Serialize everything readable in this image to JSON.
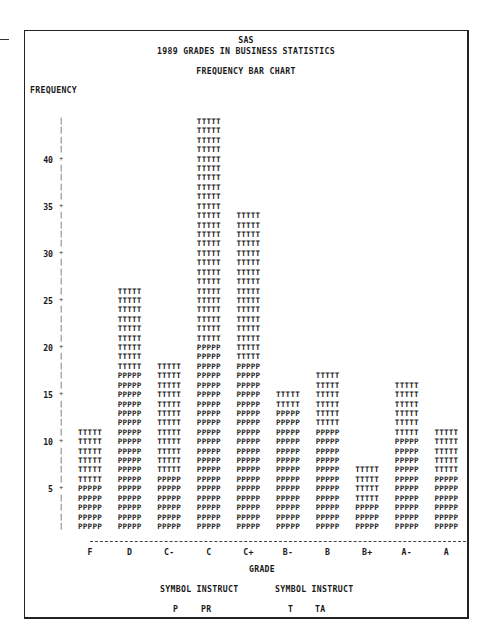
{
  "header": {
    "line1": "SAS",
    "line2": "1989 GRADES IN BUSINESS STATISTICS",
    "chart_title": "FREQUENCY BAR CHART",
    "y_axis_label": "FREQUENCY"
  },
  "x_axis_title": "GRADE",
  "legend": {
    "header_left": "SYMBOL INSTRUCT",
    "header_right": "SYMBOL INSTRUCT",
    "entries": [
      {
        "symbol": "P",
        "instruct": "PR"
      },
      {
        "symbol": "T",
        "instruct": "TA"
      }
    ]
  },
  "y_ticks": [
    "5",
    "10",
    "15",
    "20",
    "25",
    "30",
    "35",
    "40"
  ],
  "chart_data": {
    "type": "bar",
    "stacked": true,
    "title": "FREQUENCY BAR CHART",
    "subtitle": "SAS 1989 GRADES IN BUSINESS STATISTICS",
    "xlabel": "GRADE",
    "ylabel": "FREQUENCY",
    "categories": [
      "F",
      "D",
      "C-",
      "C",
      "C+",
      "B-",
      "B",
      "B+",
      "A-",
      "A"
    ],
    "series": [
      {
        "name": "PR",
        "symbol": "P",
        "values": [
          5,
          17,
          6,
          20,
          18,
          13,
          11,
          3,
          10,
          6
        ]
      },
      {
        "name": "TA",
        "symbol": "T",
        "values": [
          6,
          9,
          12,
          24,
          16,
          2,
          6,
          4,
          6,
          5
        ]
      }
    ],
    "totals": [
      11,
      26,
      18,
      44,
      34,
      15,
      17,
      7,
      16,
      11
    ],
    "y_ticks": [
      5,
      10,
      15,
      20,
      25,
      30,
      35,
      40
    ],
    "ylim": [
      0,
      44
    ],
    "grid": false,
    "legend_position": "bottom"
  }
}
